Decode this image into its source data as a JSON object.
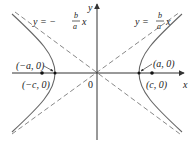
{
  "diagram": {
    "type": "hyperbola",
    "axes": {
      "x_label": "x",
      "y_label": "y",
      "origin_label": "0"
    },
    "asymptotes": {
      "negative": {
        "lhs": "y = −",
        "num": "b",
        "den": "a",
        "var": "x"
      },
      "positive": {
        "lhs": "y = ",
        "num": "b",
        "den": "a",
        "var": "x"
      }
    },
    "points": {
      "left_vertex": "(−a, 0)",
      "right_vertex": "(a, 0)",
      "left_focus": "(−c, 0)",
      "right_focus": "(c, 0)"
    },
    "colors": {
      "curve": "#555555",
      "asymptote": "#777777",
      "axis": "#333333"
    }
  }
}
